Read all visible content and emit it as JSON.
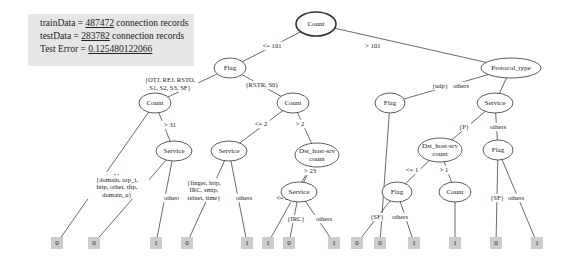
{
  "info": {
    "train_prefix": "trainData = ",
    "train_value": "487472",
    "train_suffix": " connection records",
    "test_prefix": "testData = ",
    "test_value": "283782",
    "test_suffix": " connection records",
    "error_prefix": "Test Error = ",
    "error_value": "0.125480122066"
  },
  "nodes": [
    {
      "id": "root",
      "label": "Count",
      "x": 316,
      "y": 24,
      "rx": 20,
      "ry": 12,
      "bold": true
    },
    {
      "id": "flag1",
      "label": "Flag",
      "x": 230,
      "y": 68,
      "rx": 16,
      "ry": 10
    },
    {
      "id": "proto",
      "label": "Protocol_type",
      "x": 511,
      "y": 68,
      "rx": 30,
      "ry": 10
    },
    {
      "id": "count2",
      "label": "Count",
      "x": 155,
      "y": 103,
      "rx": 16,
      "ry": 10
    },
    {
      "id": "count3",
      "label": "Count",
      "x": 293,
      "y": 103,
      "rx": 16,
      "ry": 10
    },
    {
      "id": "flag2",
      "label": "Flag",
      "x": 390,
      "y": 103,
      "rx": 15,
      "ry": 10
    },
    {
      "id": "service1",
      "label": "Service",
      "x": 495,
      "y": 103,
      "rx": 18,
      "ry": 10
    },
    {
      "id": "service2",
      "label": "Service",
      "x": 174,
      "y": 151,
      "rx": 18,
      "ry": 10
    },
    {
      "id": "service3",
      "label": "Service",
      "x": 229,
      "y": 151,
      "rx": 18,
      "ry": 10
    },
    {
      "id": "dsthost1",
      "label": "Dst_host-srv|count",
      "x": 317,
      "y": 155,
      "rx": 22,
      "ry": 12
    },
    {
      "id": "dsthost2",
      "label": "Dst_host-srv|count",
      "x": 440,
      "y": 150,
      "rx": 22,
      "ry": 12
    },
    {
      "id": "flag3",
      "label": "Flag",
      "x": 498,
      "y": 150,
      "rx": 15,
      "ry": 10
    },
    {
      "id": "service4",
      "label": "Service",
      "x": 299,
      "y": 192,
      "rx": 18,
      "ry": 10
    },
    {
      "id": "flag4",
      "label": "Flag",
      "x": 397,
      "y": 192,
      "rx": 15,
      "ry": 10
    },
    {
      "id": "count4",
      "label": "Count",
      "x": 455,
      "y": 192,
      "rx": 16,
      "ry": 10
    }
  ],
  "leaves": [
    {
      "label": "0",
      "x": 57,
      "y": 243
    },
    {
      "label": "0",
      "x": 94,
      "y": 243
    },
    {
      "label": "1",
      "x": 156,
      "y": 243
    },
    {
      "label": "0",
      "x": 187,
      "y": 243
    },
    {
      "label": "1",
      "x": 247,
      "y": 243
    },
    {
      "label": "1",
      "x": 268,
      "y": 243
    },
    {
      "label": "0",
      "x": 289,
      "y": 243
    },
    {
      "label": "1",
      "x": 334,
      "y": 243
    },
    {
      "label": "0",
      "x": 357,
      "y": 243
    },
    {
      "label": "0",
      "x": 380,
      "y": 243
    },
    {
      "label": "1",
      "x": 414,
      "y": 243
    },
    {
      "label": "1",
      "x": 455,
      "y": 243
    },
    {
      "label": "0",
      "x": 496,
      "y": 243
    },
    {
      "label": "1",
      "x": 537,
      "y": 243
    }
  ],
  "edges": [
    {
      "from": [
        316,
        24
      ],
      "to": [
        230,
        68
      ],
      "label": "<= 101",
      "lx": 272,
      "ly": 46
    },
    {
      "from": [
        316,
        24
      ],
      "to": [
        511,
        68
      ],
      "label": "> 101",
      "lx": 373,
      "ly": 46
    },
    {
      "from": [
        230,
        68
      ],
      "to": [
        155,
        103
      ],
      "label": "{OTJ, REJ, RSTO,|S1, S2, S3, SF}",
      "lx": 170,
      "ly": 84
    },
    {
      "from": [
        230,
        68
      ],
      "to": [
        293,
        103
      ],
      "label": "{RSTR, S0}",
      "lx": 262,
      "ly": 85
    },
    {
      "from": [
        511,
        68
      ],
      "to": [
        390,
        103
      ],
      "label": "{udp}",
      "lx": 440,
      "ly": 86
    },
    {
      "from": [
        511,
        68
      ],
      "to": [
        495,
        103
      ],
      "label": "others",
      "lx": 461,
      "ly": 86
    },
    {
      "from": [
        155,
        103
      ],
      "to": [
        57,
        243
      ],
      "label": "<= 31",
      "lx": 112,
      "ly": 176
    },
    {
      "from": [
        155,
        103
      ],
      "to": [
        174,
        151
      ],
      "label": "> 31",
      "lx": 170,
      "ly": 125
    },
    {
      "from": [
        174,
        151
      ],
      "to": [
        94,
        243
      ],
      "label": "{domain, urp_i,|http, other, tftp,|domain_u}",
      "lx": 117,
      "ly": 187
    },
    {
      "from": [
        174,
        151
      ],
      "to": [
        156,
        243
      ],
      "label": "others",
      "lx": 172,
      "ly": 198
    },
    {
      "from": [
        293,
        103
      ],
      "to": [
        229,
        151
      ],
      "label": "<= 2",
      "lx": 261,
      "ly": 124
    },
    {
      "from": [
        293,
        103
      ],
      "to": [
        317,
        155
      ],
      "label": "> 2",
      "lx": 300,
      "ly": 124
    },
    {
      "from": [
        229,
        151
      ],
      "to": [
        187,
        243
      ],
      "label": "{finger, http,|IRC, smtp,|telnet, time}",
      "lx": 204,
      "ly": 190
    },
    {
      "from": [
        229,
        151
      ],
      "to": [
        247,
        243
      ],
      "label": "others",
      "lx": 244,
      "ly": 198
    },
    {
      "from": [
        317,
        155
      ],
      "to": [
        268,
        243
      ],
      "label": "<= 23",
      "lx": 284,
      "ly": 198
    },
    {
      "from": [
        317,
        155
      ],
      "to": [
        299,
        192
      ],
      "label": "> 23",
      "lx": 310,
      "ly": 171
    },
    {
      "from": [
        299,
        192
      ],
      "to": [
        289,
        243
      ],
      "label": "{IRC}",
      "lx": 296,
      "ly": 219
    },
    {
      "from": [
        299,
        192
      ],
      "to": [
        334,
        243
      ],
      "label": "others",
      "lx": 324,
      "ly": 219
    },
    {
      "from": [
        390,
        103
      ],
      "to": [
        380,
        243
      ],
      "label": "",
      "lx": 0,
      "ly": 0
    },
    {
      "from": [
        495,
        103
      ],
      "to": [
        440,
        150
      ],
      "label": "{P}",
      "lx": 464,
      "ly": 127
    },
    {
      "from": [
        495,
        103
      ],
      "to": [
        498,
        150
      ],
      "label": "others",
      "lx": 498,
      "ly": 127
    },
    {
      "from": [
        440,
        150
      ],
      "to": [
        397,
        192
      ],
      "label": "<= 1",
      "lx": 412,
      "ly": 170
    },
    {
      "from": [
        440,
        150
      ],
      "to": [
        455,
        192
      ],
      "label": "> 1",
      "lx": 444,
      "ly": 170
    },
    {
      "from": [
        397,
        192
      ],
      "to": [
        357,
        243
      ],
      "label": "{SF}",
      "lx": 377,
      "ly": 217
    },
    {
      "from": [
        397,
        192
      ],
      "to": [
        414,
        243
      ],
      "label": "others",
      "lx": 400,
      "ly": 217
    },
    {
      "from": [
        455,
        192
      ],
      "to": [
        455,
        243
      ],
      "label": "",
      "lx": 0,
      "ly": 0
    },
    {
      "from": [
        498,
        150
      ],
      "to": [
        496,
        243
      ],
      "label": "{SF}",
      "lx": 497,
      "ly": 198
    },
    {
      "from": [
        498,
        150
      ],
      "to": [
        537,
        243
      ],
      "label": "others",
      "lx": 516,
      "ly": 198
    }
  ]
}
